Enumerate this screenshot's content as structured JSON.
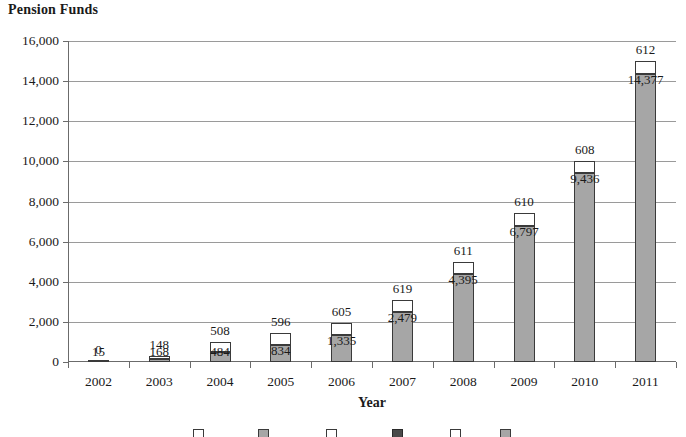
{
  "chart_data": {
    "type": "bar",
    "subtype": "stacked-bar",
    "title": "Pension Funds",
    "xlabel": "Year",
    "ylabel": "",
    "categories": [
      "2002",
      "2003",
      "2004",
      "2005",
      "2006",
      "2007",
      "2008",
      "2009",
      "2010",
      "2011"
    ],
    "ylim": [
      0,
      16000
    ],
    "ytick_values": [
      0,
      2000,
      4000,
      6000,
      8000,
      10000,
      12000,
      14000,
      16000
    ],
    "ytick_labels": [
      "0",
      "2,000",
      "4,000",
      "6,000",
      "8,000",
      "10,000",
      "12,000",
      "14,000",
      "16,000"
    ],
    "grid": true,
    "legend_position": "bottom",
    "legend_clipped": true,
    "series": [
      {
        "name": "lower",
        "color": "#a6a6a6",
        "values": [
          15,
          168,
          484,
          834,
          1335,
          2479,
          4395,
          6797,
          9436,
          14377
        ],
        "labels": [
          "15",
          "168",
          "484",
          "834",
          "1,335",
          "2,479",
          "4,395",
          "6,797",
          "9,436",
          "14,377"
        ]
      },
      {
        "name": "upper",
        "color": "#ffffff",
        "values": [
          0,
          148,
          508,
          596,
          605,
          619,
          611,
          610,
          608,
          612
        ],
        "labels": [
          "0",
          "148",
          "508",
          "596",
          "605",
          "619",
          "611",
          "610",
          "608",
          "612"
        ]
      }
    ],
    "legend_entries": [
      {
        "swatch": "upper"
      },
      {
        "swatch": "lower"
      },
      {
        "swatch": "upper"
      },
      {
        "swatch": "dark"
      },
      {
        "swatch": "upper"
      },
      {
        "swatch": "lower"
      }
    ]
  }
}
